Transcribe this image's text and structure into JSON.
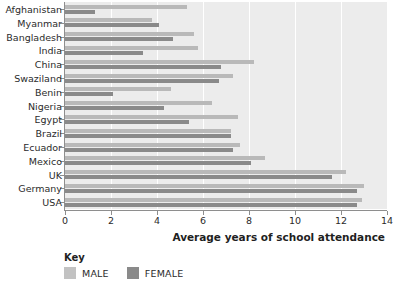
{
  "chart_data": {
    "type": "bar",
    "orientation": "horizontal",
    "title": "",
    "xlabel": "Average years of school attendance",
    "ylabel": "",
    "xlim": [
      0,
      14
    ],
    "xticks": [
      0,
      2,
      4,
      6,
      8,
      10,
      12,
      14
    ],
    "grid": true,
    "legend_position": "bottom-left",
    "legend_title": "Key",
    "categories": [
      "Afghanistan",
      "Myanmar",
      "Bangladesh",
      "India",
      "China",
      "Swaziland",
      "Benin",
      "Nigeria",
      "Egypt",
      "Brazil",
      "Ecuador",
      "Mexico",
      "UK",
      "Germany",
      "USA"
    ],
    "series": [
      {
        "name": "MALE",
        "color": "#b9b9b9",
        "values": [
          5.3,
          3.8,
          5.6,
          5.8,
          8.2,
          7.3,
          4.6,
          6.4,
          7.5,
          7.2,
          7.6,
          8.7,
          12.2,
          13.0,
          12.9
        ]
      },
      {
        "name": "FEMALE",
        "color": "#8a8a8a",
        "values": [
          1.3,
          4.1,
          4.7,
          3.4,
          6.8,
          6.7,
          2.1,
          4.3,
          5.4,
          7.2,
          7.3,
          8.1,
          11.6,
          12.7,
          12.7
        ]
      }
    ]
  },
  "colors": {
    "plot_background": "#ececec",
    "gridline": "#ffffff",
    "axis": "#8e8e8e",
    "male": "#b9b9b9",
    "female": "#8a8a8a",
    "text": "#2b2b2b"
  }
}
